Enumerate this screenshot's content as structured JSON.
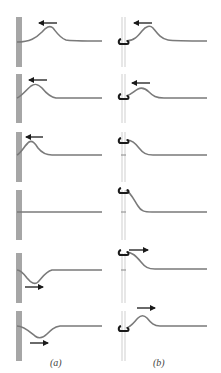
{
  "figure": {
    "colors": {
      "wall": "#a6a6a6",
      "wall_edge": "#8e8e8e",
      "string": "#7a7a7a",
      "rod": "#d4d4d4",
      "ring": "#1a1a1a",
      "arrow": "#1a1a1a"
    },
    "columns": [
      {
        "id": "a",
        "label": "(a)",
        "description": "Pulse reflection at fixed end (wall)"
      },
      {
        "id": "b",
        "label": "(b)",
        "description": "Pulse reflection at free end (ring on rod)"
      }
    ],
    "rows": [
      {
        "index": 1,
        "a": "incoming upward pulse moving left",
        "b": "incoming upward pulse moving left"
      },
      {
        "index": 2,
        "a": "pulse nearing wall, moving left",
        "b": "pulse nearing ring, moving left"
      },
      {
        "index": 3,
        "a": "pulse at wall, moving left",
        "b": "ring rising"
      },
      {
        "index": 4,
        "a": "string flat (cancellation)",
        "b": "ring at maximum displacement"
      },
      {
        "index": 5,
        "a": "inverted pulse moving right",
        "b": "ring descending, pulse moving right"
      },
      {
        "index": 6,
        "a": "inverted reflected pulse moving right",
        "b": "upright reflected pulse moving right"
      }
    ]
  },
  "labels": {
    "a": "(a)",
    "b": "(b)"
  }
}
